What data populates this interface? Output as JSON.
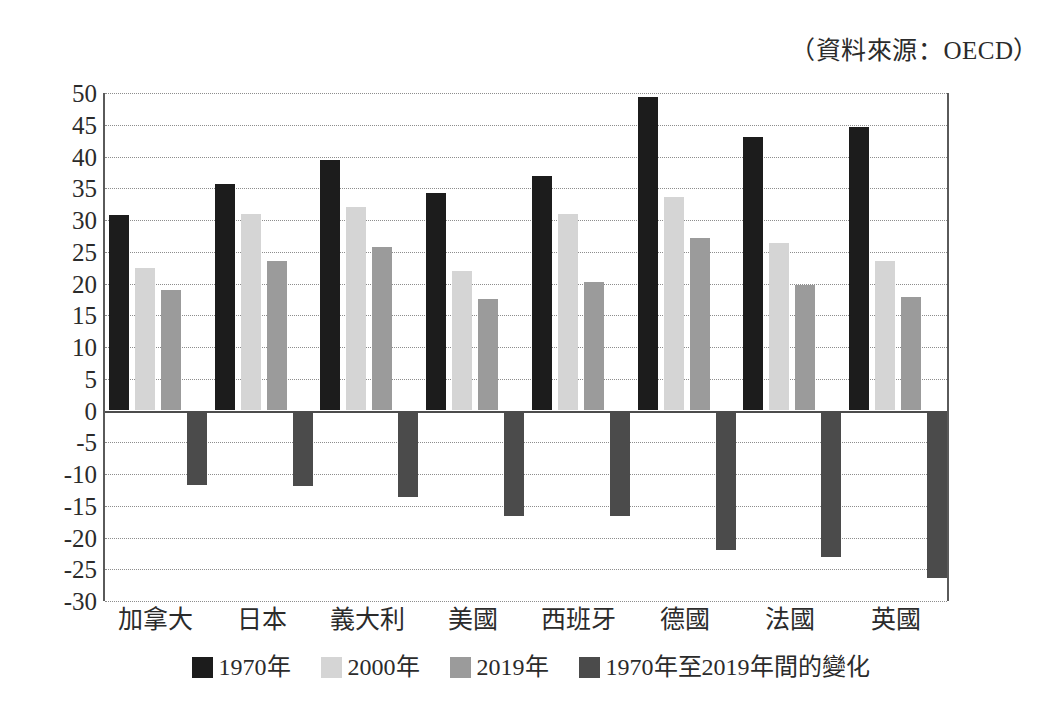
{
  "source_note": "（資料來源：OECD）",
  "chart_data": {
    "type": "bar",
    "title": "",
    "subtitle": "",
    "xlabel": "",
    "ylabel": "",
    "ylim": [
      -30,
      50
    ],
    "ytick_step": 5,
    "yticks": [
      50,
      45,
      40,
      35,
      30,
      25,
      20,
      15,
      10,
      5,
      0,
      -5,
      -10,
      -15,
      -20,
      -25,
      -30
    ],
    "grid": true,
    "legend_position": "bottom",
    "categories": [
      "加拿大",
      "日本",
      "義大利",
      "美國",
      "西班牙",
      "德國",
      "法國",
      "英國"
    ],
    "series": [
      {
        "name": "1970年",
        "color": "#1c1c1c",
        "values": [
          30.8,
          35.6,
          39.5,
          34.3,
          37.0,
          49.3,
          43.1,
          44.7
        ]
      },
      {
        "name": "2000年",
        "color": "#d5d5d5",
        "values": [
          22.4,
          31.0,
          32.0,
          21.9,
          30.9,
          33.6,
          26.3,
          23.5
        ]
      },
      {
        "name": "2019年",
        "color": "#9b9b9b",
        "values": [
          19.0,
          23.6,
          25.8,
          17.6,
          20.3,
          27.1,
          19.8,
          17.9
        ]
      },
      {
        "name": "1970年至2019年間的變化",
        "color": "#4b4b4b",
        "values": [
          -11.8,
          -11.9,
          -13.7,
          -16.6,
          -16.6,
          -22.0,
          -23.1,
          -26.4
        ]
      }
    ]
  }
}
